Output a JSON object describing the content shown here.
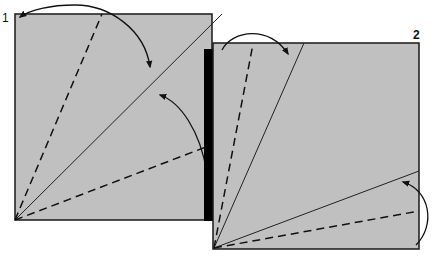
{
  "diagram": {
    "type": "origami-folding-instructions",
    "colors": {
      "paper": "#c0c0c0",
      "edge": "#1a1a1a",
      "background": "#ffffff",
      "bar": "#000000"
    },
    "steps": [
      {
        "label": "1",
        "description": "Square with valley-fold (dashed) lines and a diagonal crease from the bottom-left corner; arrows indicate folding top-left edge and right edge to the diagonal",
        "creases": [
          {
            "kind": "dashed",
            "name": "valley-fold-upper"
          },
          {
            "kind": "solid",
            "name": "diagonal-crease"
          },
          {
            "kind": "dashed",
            "name": "valley-fold-lower"
          }
        ],
        "arrows": [
          "fold-top-edge-arrow",
          "fold-right-edge-arrow"
        ]
      },
      {
        "label": "2",
        "description": "Square with left flap folded (shown as black edge); creases and arrows for the next folds",
        "creases": [
          {
            "kind": "dashed",
            "name": "valley-fold-left"
          },
          {
            "kind": "solid",
            "name": "crease-upper"
          },
          {
            "kind": "solid",
            "name": "crease-lower"
          },
          {
            "kind": "dashed",
            "name": "valley-fold-bottom"
          }
        ],
        "arrows": [
          "fold-top-arrow",
          "fold-bottom-right-arrow"
        ]
      }
    ]
  }
}
